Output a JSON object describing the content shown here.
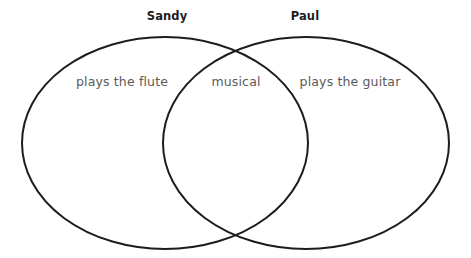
{
  "diagram": {
    "type": "venn",
    "canvas": {
      "width": 471,
      "height": 258,
      "background": "#ffffff"
    },
    "stroke_color": "#1d1d1d",
    "stroke_width": 2,
    "title_color": "#1d1d1d",
    "label_color": "#5a5a5a",
    "sets": [
      {
        "id": "sandy",
        "title": "Sandy",
        "title_x": 167,
        "title_y": 17,
        "ellipse": {
          "cx": 165,
          "cy": 143,
          "rx": 143,
          "ry": 106
        },
        "exclusive_label": "plays the flute",
        "label_x": 122,
        "label_y": 86
      },
      {
        "id": "paul",
        "title": "Paul",
        "title_x": 305,
        "title_y": 17,
        "ellipse": {
          "cx": 306,
          "cy": 143,
          "rx": 143,
          "ry": 106
        },
        "exclusive_label": "plays the guitar",
        "label_x": 350,
        "label_y": 86
      }
    ],
    "intersection": {
      "label": "musical",
      "label_x": 236,
      "label_y": 86,
      "top_crossing": {
        "x": 236,
        "y": 45
      },
      "bottom_crossing": {
        "x": 236,
        "y": 241
      }
    }
  }
}
